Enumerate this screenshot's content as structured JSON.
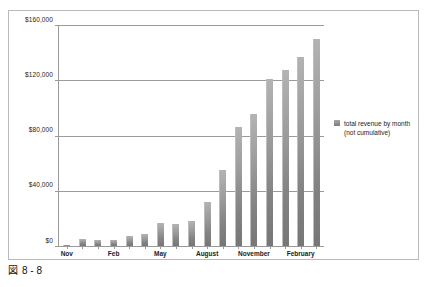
{
  "caption": {
    "marker": "図",
    "text": "8 - 8"
  },
  "legend": {
    "entry_label": "total revenue by month\n(not cumulative)",
    "swatch_color": "#8f8f8f",
    "position": "right"
  },
  "chart_data": {
    "type": "bar",
    "title": "",
    "subtitle": "",
    "xlabel": "",
    "ylabel": "",
    "grid": true,
    "legend_position": "right",
    "ylim": [
      0,
      160000
    ],
    "ytick_labels": [
      "$0",
      "$40,000",
      "$80,000",
      "$120,000",
      "$160,000"
    ],
    "ytick_values": [
      0,
      40000,
      80000,
      120000,
      160000
    ],
    "categories": [
      "Nov",
      "Dec",
      "Jan",
      "Feb",
      "Mar",
      "Apr",
      "May",
      "Jun",
      "Jul",
      "August",
      "Sep",
      "Oct",
      "November",
      "Dec",
      "Jan",
      "February",
      "Mar"
    ],
    "xtick_labels_shown": [
      "Nov",
      "Feb",
      "May",
      "August",
      "November",
      "February"
    ],
    "series": [
      {
        "name": "total revenue by month (not cumulative)",
        "values": [
          500,
          4000,
          3500,
          3500,
          6000,
          7500,
          14000,
          13500,
          15000,
          27000,
          50000,
          80000,
          90000,
          115000,
          121000,
          131000,
          138000
        ]
      }
    ],
    "values_note_bar_count": 17
  },
  "bars_render": [
    {
      "label": "Nov",
      "value": 500,
      "height_pct": 0.4
    },
    {
      "label": "Dec",
      "value": 4000,
      "height_pct": 3.0
    },
    {
      "label": "Jan",
      "value": 3500,
      "height_pct": 2.7
    },
    {
      "label": "Feb",
      "value": 3500,
      "height_pct": 2.7
    },
    {
      "label": "Mar",
      "value": 6000,
      "height_pct": 4.5
    },
    {
      "label": "Apr",
      "value": 7500,
      "height_pct": 5.6
    },
    {
      "label": "May",
      "value": 14000,
      "height_pct": 10.4
    },
    {
      "label": "Jun",
      "value": 13500,
      "height_pct": 10.0
    },
    {
      "label": "Jul",
      "value": 15000,
      "height_pct": 11.2
    },
    {
      "label": "August",
      "value": 27000,
      "height_pct": 20.0
    },
    {
      "label": "Sep",
      "value": 50000,
      "height_pct": 34.5
    },
    {
      "label": "Oct",
      "value": 80000,
      "height_pct": 54.0
    },
    {
      "label": "November",
      "value": 90000,
      "height_pct": 60.0
    },
    {
      "label": "Dec",
      "value": 115000,
      "height_pct": 76.0
    },
    {
      "label": "Jan",
      "value": 121000,
      "height_pct": 80.0
    },
    {
      "label": "February",
      "value": 131000,
      "height_pct": 86.0
    },
    {
      "label": "Mar",
      "value": 138000,
      "height_pct": 94.0
    }
  ],
  "gridlines": [
    {
      "label": "$160,000",
      "pos_pct": 100
    },
    {
      "label": "$120,000",
      "pos_pct": 75
    },
    {
      "label": "$80,000",
      "pos_pct": 50
    },
    {
      "label": "$40,000",
      "pos_pct": 25
    },
    {
      "label": "$0",
      "pos_pct": 0
    }
  ],
  "xticks": [
    {
      "index": 0,
      "label": "Nov"
    },
    {
      "index": 3,
      "label": "Feb"
    },
    {
      "index": 6,
      "label": "May"
    },
    {
      "index": 9,
      "label": "August"
    },
    {
      "index": 12,
      "label": "November"
    },
    {
      "index": 15,
      "label": "February"
    }
  ]
}
